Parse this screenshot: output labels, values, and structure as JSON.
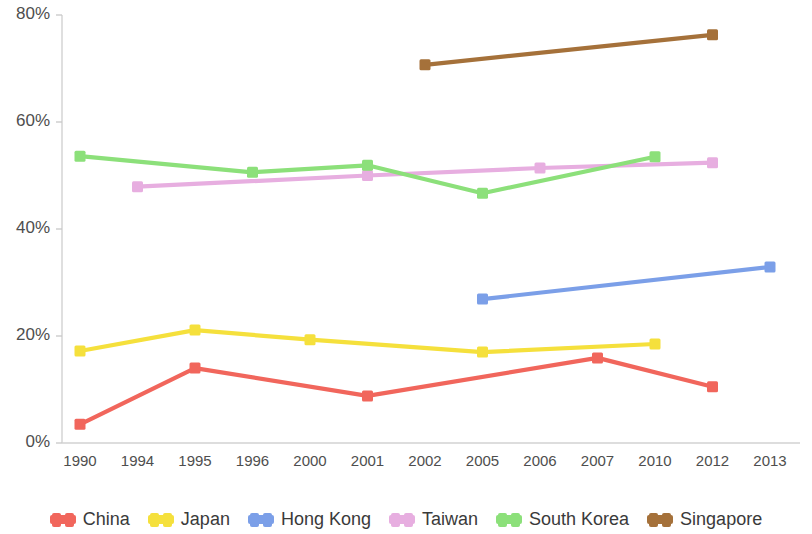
{
  "chart_data": {
    "type": "line",
    "title": "",
    "xlabel": "",
    "ylabel": "",
    "categories": [
      "1990",
      "1994",
      "1995",
      "1996",
      "2000",
      "2001",
      "2002",
      "2005",
      "2006",
      "2007",
      "2010",
      "2012",
      "2013"
    ],
    "ytick_labels": [
      "0%",
      "20%",
      "40%",
      "60%",
      "80%"
    ],
    "ytick_values": [
      0,
      20,
      40,
      60,
      80
    ],
    "ylim": [
      0,
      80
    ],
    "grid": false,
    "legend_position": "bottom",
    "value_suffix": "%",
    "series": [
      {
        "name": "China",
        "color": "#F1665C",
        "points": [
          {
            "x": "1990",
            "y": 3.5
          },
          {
            "x": "1995",
            "y": 14.0
          },
          {
            "x": "2001",
            "y": 8.8
          },
          {
            "x": "2007",
            "y": 15.9
          },
          {
            "x": "2012",
            "y": 10.5
          }
        ]
      },
      {
        "name": "Japan",
        "color": "#F5E03C",
        "points": [
          {
            "x": "1990",
            "y": 17.2
          },
          {
            "x": "1995",
            "y": 21.1
          },
          {
            "x": "2000",
            "y": 19.3
          },
          {
            "x": "2005",
            "y": 17.0
          },
          {
            "x": "2010",
            "y": 18.5
          }
        ]
      },
      {
        "name": "Hong Kong",
        "color": "#7B9FE8",
        "points": [
          {
            "x": "2005",
            "y": 26.9
          },
          {
            "x": "2013",
            "y": 32.9
          }
        ]
      },
      {
        "name": "Taiwan",
        "color": "#E7AEE0",
        "points": [
          {
            "x": "1994",
            "y": 47.9
          },
          {
            "x": "2001",
            "y": 50.0
          },
          {
            "x": "2006",
            "y": 51.4
          },
          {
            "x": "2012",
            "y": 52.4
          }
        ]
      },
      {
        "name": "South Korea",
        "color": "#8CE07A",
        "points": [
          {
            "x": "1990",
            "y": 53.6
          },
          {
            "x": "1996",
            "y": 50.6
          },
          {
            "x": "2001",
            "y": 51.9
          },
          {
            "x": "2005",
            "y": 46.7
          },
          {
            "x": "2010",
            "y": 53.5
          }
        ]
      },
      {
        "name": "Singapore",
        "color": "#A5713A",
        "points": [
          {
            "x": "2002",
            "y": 70.7
          },
          {
            "x": "2012",
            "y": 76.3
          }
        ]
      }
    ]
  }
}
